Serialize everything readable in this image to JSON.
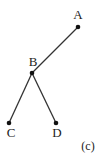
{
  "diagram": {
    "type": "tree",
    "caption": "(c)",
    "nodes": [
      {
        "id": "A",
        "label": "A",
        "x": 78,
        "y": 27,
        "label_x": 78,
        "label_y": 19
      },
      {
        "id": "B",
        "label": "B",
        "x": 32,
        "y": 73,
        "label_x": 33,
        "label_y": 66
      },
      {
        "id": "C",
        "label": "C",
        "x": 9,
        "y": 123,
        "label_x": 11,
        "label_y": 137
      },
      {
        "id": "D",
        "label": "D",
        "x": 56,
        "y": 123,
        "label_x": 57,
        "label_y": 137
      }
    ],
    "edges": [
      {
        "from": "A",
        "to": "B"
      },
      {
        "from": "B",
        "to": "C"
      },
      {
        "from": "B",
        "to": "D"
      }
    ]
  }
}
